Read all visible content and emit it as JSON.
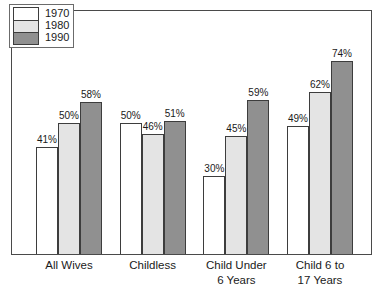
{
  "chart_data": {
    "type": "bar",
    "title": "",
    "xlabel": "",
    "ylabel": "",
    "ylim": [
      0,
      93
    ],
    "grid": false,
    "legend_position": "top-left",
    "categories": [
      "All Wives",
      "Childless",
      "Child Under\n6 Years",
      "Child 6 to\n17 Years"
    ],
    "series": [
      {
        "name": "1970",
        "color": "#ffffff",
        "values": [
          41,
          50,
          30,
          49
        ],
        "labels": [
          "41%",
          "50%",
          "30%",
          "49%"
        ]
      },
      {
        "name": "1980",
        "color": "#e4e4e4",
        "values": [
          50,
          46,
          45,
          62
        ],
        "labels": [
          "50%",
          "46%",
          "45%",
          "62%"
        ]
      },
      {
        "name": "1990",
        "color": "#909090",
        "values": [
          58,
          51,
          59,
          74
        ],
        "labels": [
          "58%",
          "51%",
          "59%",
          "74%"
        ]
      }
    ]
  },
  "legend": {
    "items": [
      {
        "label": "1970",
        "color": "#ffffff"
      },
      {
        "label": "1980",
        "color": "#e4e4e4"
      },
      {
        "label": "1990",
        "color": "#909090"
      }
    ]
  },
  "style": {
    "frame_color": "#4a4a4a",
    "bar_outline_color": "#3d3d3d",
    "text_color": "#1a1a1a",
    "background": "#ffffff"
  }
}
